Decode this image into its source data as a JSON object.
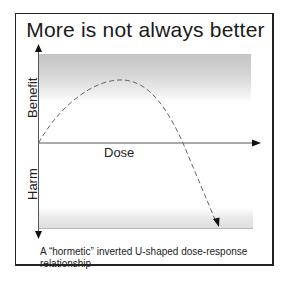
{
  "diagram": {
    "title": "More is not always better",
    "y_axis": {
      "upper_label": "Benefit",
      "lower_label": "Harm"
    },
    "x_axis": {
      "label": "Dose"
    },
    "curve": {
      "style": "dashed",
      "shape": "inverted U",
      "description": "Starts at origin, rises to a peak of benefit, then falls below zero into harm with an arrowhead"
    },
    "caption": "A “hormetic” inverted U-shaped dose-response relationship",
    "colors": {
      "border": "#222222",
      "axis": "#555555",
      "band": "#c8c8c8",
      "curve": "#666666",
      "text": "#222222"
    }
  }
}
